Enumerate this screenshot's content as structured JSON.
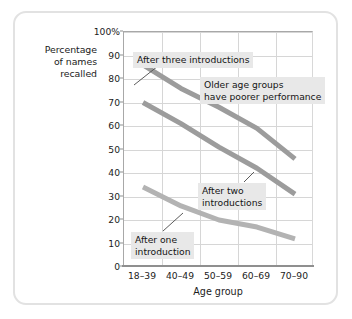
{
  "chart_data": {
    "type": "line",
    "title": "",
    "xlabel": "Age group",
    "ylabel": "Percentage of names recalled",
    "categories": [
      "18–39",
      "40–49",
      "50–59",
      "60–69",
      "70–90"
    ],
    "ylim": [
      0,
      100
    ],
    "ytick_labels": [
      "0",
      "10",
      "20",
      "30",
      "40",
      "50",
      "60",
      "70",
      "80",
      "90",
      "100%"
    ],
    "ytick_values": [
      0,
      10,
      20,
      30,
      40,
      50,
      60,
      70,
      80,
      90,
      100
    ],
    "grid": true,
    "legend": "none (inline annotations)",
    "series": [
      {
        "name": "After three introductions",
        "values": [
          86,
          76,
          68,
          59,
          46
        ],
        "color": "#9c9c9c"
      },
      {
        "name": "After two introductions",
        "values": [
          70,
          61,
          51,
          42,
          31
        ],
        "color": "#9c9c9c"
      },
      {
        "name": "After one introduction",
        "values": [
          34,
          26,
          20,
          17,
          12
        ],
        "color": "#b3b3b3"
      }
    ],
    "annotations": [
      {
        "id": "after-three",
        "text": "After three introductions",
        "points_to": "series-1"
      },
      {
        "id": "older-groups",
        "text_line1": "Older age groups",
        "text_line2": "have poorer performance",
        "points_to": "none"
      },
      {
        "id": "after-two",
        "text_line1": "After two",
        "text_line2": "introductions",
        "points_to": "series-2"
      },
      {
        "id": "after-one",
        "text_line1": "After one",
        "text_line2": "introduction",
        "points_to": "series-3"
      }
    ]
  },
  "axis": {
    "y_title_line1": "Percentage",
    "y_title_line2": "of names",
    "y_title_line3": "recalled",
    "x_title": "Age group"
  },
  "colors": {
    "line_dark": "#9c9c9c",
    "line_light": "#b3b3b3",
    "gridline": "#d6d6d6",
    "axis": "#8f8f8f",
    "frame": "#e2e2e2",
    "annotation_bg": "#e8e8e8",
    "text": "#1b1b1b"
  }
}
